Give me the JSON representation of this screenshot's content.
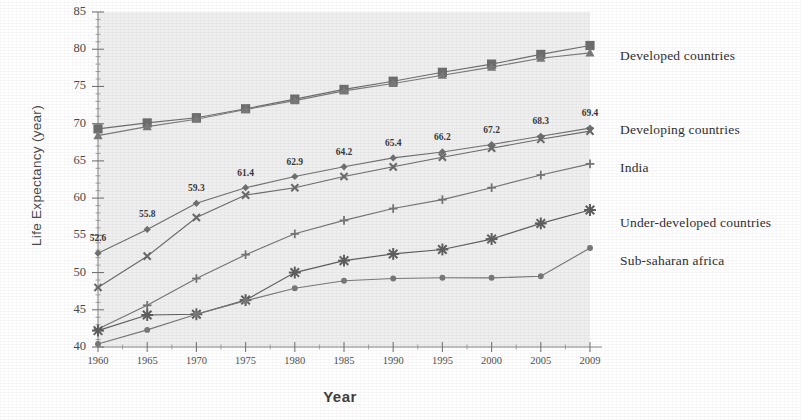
{
  "chart_data": {
    "type": "line",
    "title": "",
    "xlabel": "Year",
    "ylabel": "Life Expectancy (year)",
    "x": [
      1960,
      1965,
      1970,
      1975,
      1980,
      1985,
      1990,
      1995,
      2000,
      2005,
      2009
    ],
    "xticklabels": [
      "1960",
      "1965",
      "1970",
      "1975",
      "1980",
      "1985",
      "1990",
      "1995",
      "2000",
      "2005",
      "2009"
    ],
    "yticklabels": [
      "40",
      "45",
      "50",
      "55",
      "60",
      "65",
      "70",
      "75",
      "80",
      "85"
    ],
    "ylim": [
      40,
      85
    ],
    "ytick_step": 5,
    "grid": false,
    "legend_position": "right",
    "plot_background": "#efefef",
    "series": [
      {
        "name": "Developed countries",
        "marker": "square",
        "color": "#6e6e6e",
        "values": [
          69.3,
          70.1,
          70.8,
          72.0,
          73.3,
          74.6,
          75.7,
          76.9,
          78.0,
          79.3,
          80.5
        ]
      },
      {
        "name": "Developed-secondary",
        "marker": "triangle",
        "color": "#7a7a7a",
        "values": [
          68.4,
          69.6,
          70.6,
          71.9,
          73.1,
          74.4,
          75.4,
          76.5,
          77.6,
          78.8,
          79.5
        ]
      },
      {
        "name": "Developing countries",
        "marker": "diamond",
        "color": "#707070",
        "values": [
          52.6,
          55.8,
          59.3,
          61.4,
          62.9,
          64.2,
          65.4,
          66.2,
          67.2,
          68.3,
          69.4
        ],
        "data_labels": [
          "52.6",
          "55.8",
          "59.3",
          "61.4",
          "62.9",
          "64.2",
          "65.4",
          "66.2",
          "67.2",
          "68.3",
          "69.4"
        ]
      },
      {
        "name": "India",
        "marker": "cross",
        "color": "#6b6b6b",
        "values": [
          48.0,
          52.2,
          57.4,
          60.4,
          61.4,
          62.9,
          64.2,
          65.5,
          66.7,
          67.9,
          69.0
        ]
      },
      {
        "name": "Under-developed countries",
        "marker": "plus",
        "color": "#757575",
        "values": [
          42.4,
          45.6,
          49.2,
          52.4,
          55.2,
          57.0,
          58.6,
          59.8,
          61.4,
          63.1,
          64.6
        ]
      },
      {
        "name": "Sub-saharan africa",
        "marker": "asterisk",
        "color": "#5f5f5f",
        "values": [
          42.2,
          44.3,
          44.4,
          46.3,
          50.0,
          51.6,
          52.5,
          53.1,
          54.5,
          56.6,
          58.4
        ]
      },
      {
        "name": "lowest-series",
        "marker": "circle",
        "color": "#787878",
        "values": [
          40.4,
          42.3,
          44.4,
          46.2,
          47.9,
          48.9,
          49.2,
          49.3,
          49.3,
          49.5,
          53.3
        ]
      }
    ],
    "legend": [
      {
        "label": "Developed countries"
      },
      {
        "label": "Developing countries"
      },
      {
        "label": "India"
      },
      {
        "label": "Under-developed countries"
      },
      {
        "label": "Sub-saharan africa"
      }
    ]
  }
}
